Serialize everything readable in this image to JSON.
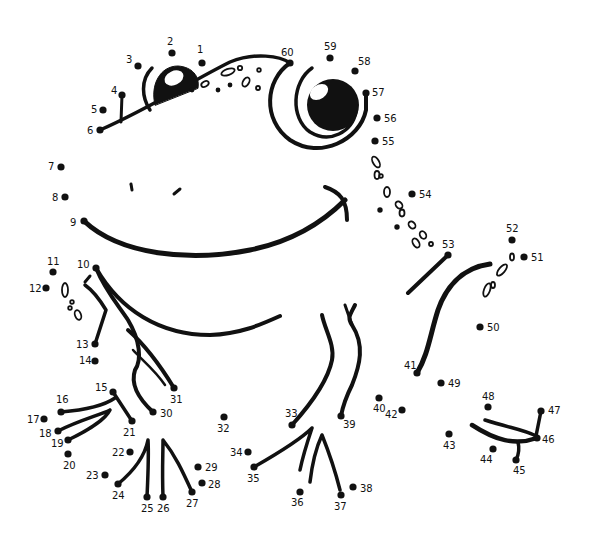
{
  "puzzle": {
    "title": "Frog dot-to-dot",
    "ink_color": "#111111",
    "background": "#ffffff",
    "dots": [
      {
        "n": "1",
        "x": 202,
        "y": 63,
        "lx": 197,
        "ly": 53
      },
      {
        "n": "2",
        "x": 172,
        "y": 53,
        "lx": 167,
        "ly": 45
      },
      {
        "n": "3",
        "x": 138,
        "y": 66,
        "lx": 126,
        "ly": 63
      },
      {
        "n": "4",
        "x": 122,
        "y": 95,
        "lx": 111,
        "ly": 94
      },
      {
        "n": "5",
        "x": 103,
        "y": 110,
        "lx": 91,
        "ly": 113
      },
      {
        "n": "6",
        "x": 100,
        "y": 130,
        "lx": 87,
        "ly": 134
      },
      {
        "n": "7",
        "x": 61,
        "y": 167,
        "lx": 48,
        "ly": 170
      },
      {
        "n": "8",
        "x": 65,
        "y": 197,
        "lx": 52,
        "ly": 201
      },
      {
        "n": "9",
        "x": 84,
        "y": 221,
        "lx": 70,
        "ly": 226
      },
      {
        "n": "10",
        "x": 96,
        "y": 268,
        "lx": 77,
        "ly": 268
      },
      {
        "n": "11",
        "x": 53,
        "y": 272,
        "lx": 47,
        "ly": 265
      },
      {
        "n": "12",
        "x": 46,
        "y": 288,
        "lx": 29,
        "ly": 292
      },
      {
        "n": "13",
        "x": 95,
        "y": 344,
        "lx": 76,
        "ly": 348
      },
      {
        "n": "14",
        "x": 95,
        "y": 361,
        "lx": 79,
        "ly": 364
      },
      {
        "n": "15",
        "x": 113,
        "y": 392,
        "lx": 95,
        "ly": 391
      },
      {
        "n": "16",
        "x": 61,
        "y": 412,
        "lx": 56,
        "ly": 403
      },
      {
        "n": "17",
        "x": 44,
        "y": 419,
        "lx": 27,
        "ly": 423
      },
      {
        "n": "18",
        "x": 58,
        "y": 431,
        "lx": 39,
        "ly": 437
      },
      {
        "n": "19",
        "x": 68,
        "y": 440,
        "lx": 51,
        "ly": 447
      },
      {
        "n": "20",
        "x": 68,
        "y": 454,
        "lx": 63,
        "ly": 469
      },
      {
        "n": "21",
        "x": 132,
        "y": 421,
        "lx": 123,
        "ly": 436
      },
      {
        "n": "22",
        "x": 130,
        "y": 452,
        "lx": 112,
        "ly": 456
      },
      {
        "n": "23",
        "x": 105,
        "y": 475,
        "lx": 86,
        "ly": 479
      },
      {
        "n": "24",
        "x": 118,
        "y": 484,
        "lx": 112,
        "ly": 499
      },
      {
        "n": "25",
        "x": 147,
        "y": 497,
        "lx": 141,
        "ly": 512
      },
      {
        "n": "26",
        "x": 163,
        "y": 497,
        "lx": 157,
        "ly": 512
      },
      {
        "n": "27",
        "x": 192,
        "y": 492,
        "lx": 186,
        "ly": 507
      },
      {
        "n": "28",
        "x": 202,
        "y": 483,
        "lx": 208,
        "ly": 488
      },
      {
        "n": "29",
        "x": 198,
        "y": 467,
        "lx": 205,
        "ly": 471
      },
      {
        "n": "30",
        "x": 153,
        "y": 412,
        "lx": 160,
        "ly": 417
      },
      {
        "n": "31",
        "x": 174,
        "y": 388,
        "lx": 170,
        "ly": 403
      },
      {
        "n": "32",
        "x": 224,
        "y": 417,
        "lx": 217,
        "ly": 432
      },
      {
        "n": "33",
        "x": 292,
        "y": 425,
        "lx": 285,
        "ly": 417
      },
      {
        "n": "34",
        "x": 248,
        "y": 452,
        "lx": 230,
        "ly": 456
      },
      {
        "n": "35",
        "x": 254,
        "y": 467,
        "lx": 247,
        "ly": 482
      },
      {
        "n": "36",
        "x": 300,
        "y": 492,
        "lx": 291,
        "ly": 506
      },
      {
        "n": "37",
        "x": 341,
        "y": 495,
        "lx": 334,
        "ly": 510
      },
      {
        "n": "38",
        "x": 353,
        "y": 487,
        "lx": 360,
        "ly": 492
      },
      {
        "n": "39",
        "x": 341,
        "y": 416,
        "lx": 343,
        "ly": 428
      },
      {
        "n": "40",
        "x": 379,
        "y": 398,
        "lx": 373,
        "ly": 412
      },
      {
        "n": "41",
        "x": 417,
        "y": 373,
        "lx": 404,
        "ly": 369
      },
      {
        "n": "42",
        "x": 402,
        "y": 410,
        "lx": 385,
        "ly": 418
      },
      {
        "n": "43",
        "x": 449,
        "y": 434,
        "lx": 443,
        "ly": 449
      },
      {
        "n": "44",
        "x": 493,
        "y": 449,
        "lx": 480,
        "ly": 463
      },
      {
        "n": "45",
        "x": 516,
        "y": 460,
        "lx": 513,
        "ly": 474
      },
      {
        "n": "46",
        "x": 537,
        "y": 438,
        "lx": 542,
        "ly": 443
      },
      {
        "n": "47",
        "x": 541,
        "y": 411,
        "lx": 548,
        "ly": 414
      },
      {
        "n": "48",
        "x": 488,
        "y": 407,
        "lx": 482,
        "ly": 400
      },
      {
        "n": "49",
        "x": 441,
        "y": 383,
        "lx": 448,
        "ly": 387
      },
      {
        "n": "50",
        "x": 480,
        "y": 327,
        "lx": 487,
        "ly": 331
      },
      {
        "n": "51",
        "x": 524,
        "y": 257,
        "lx": 531,
        "ly": 261
      },
      {
        "n": "52",
        "x": 512,
        "y": 240,
        "lx": 506,
        "ly": 232
      },
      {
        "n": "53",
        "x": 448,
        "y": 255,
        "lx": 442,
        "ly": 248
      },
      {
        "n": "54",
        "x": 412,
        "y": 194,
        "lx": 419,
        "ly": 198
      },
      {
        "n": "55",
        "x": 375,
        "y": 141,
        "lx": 382,
        "ly": 145
      },
      {
        "n": "56",
        "x": 377,
        "y": 118,
        "lx": 384,
        "ly": 122
      },
      {
        "n": "57",
        "x": 366,
        "y": 93,
        "lx": 372,
        "ly": 96
      },
      {
        "n": "58",
        "x": 355,
        "y": 71,
        "lx": 358,
        "ly": 65
      },
      {
        "n": "59",
        "x": 330,
        "y": 58,
        "lx": 324,
        "ly": 50
      },
      {
        "n": "60",
        "x": 290,
        "y": 63,
        "lx": 281,
        "ly": 56
      }
    ]
  }
}
